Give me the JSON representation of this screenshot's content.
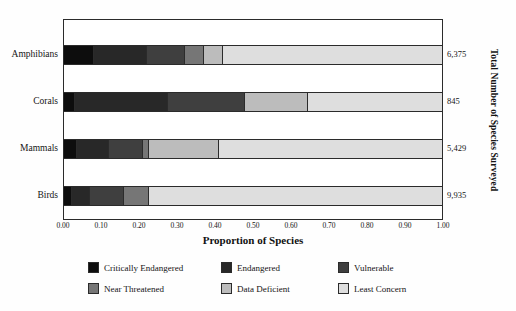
{
  "chart_data": {
    "type": "bar",
    "orientation": "horizontal",
    "stacked": true,
    "normalized": true,
    "title": "",
    "xlabel": "Proportion of Species",
    "ylabel": "Total Number of Species Surveyed",
    "xlim": [
      0,
      1
    ],
    "grid": false,
    "legend_position": "bottom",
    "xticks": [
      "0.00",
      "0.10",
      "0.20",
      "0.30",
      "0.40",
      "0.50",
      "0.60",
      "0.70",
      "0.80",
      "0.90",
      "1.00"
    ],
    "xtick_values": [
      0.0,
      0.1,
      0.2,
      0.3,
      0.4,
      0.5,
      0.6,
      0.7,
      0.8,
      0.9,
      1.0
    ],
    "categories": [
      "Amphibians",
      "Corals",
      "Mammals",
      "Birds"
    ],
    "totals": [
      "6,375",
      "845",
      "5,429",
      "9,935"
    ],
    "totals_values": [
      6375,
      845,
      5429,
      9935
    ],
    "series": [
      {
        "name": "Critically Endangered",
        "color": "#0d0d0d",
        "values": [
          0.08,
          0.03,
          0.035,
          0.02
        ]
      },
      {
        "name": "Endangered",
        "color": "#282828",
        "values": [
          0.14,
          0.245,
          0.085,
          0.05
        ]
      },
      {
        "name": "Vulnerable",
        "color": "#3f3f3f",
        "values": [
          0.1,
          0.205,
          0.09,
          0.09
        ]
      },
      {
        "name": "Near Threatened",
        "color": "#767676",
        "values": [
          0.05,
          0.0,
          0.015,
          0.065
        ]
      },
      {
        "name": "Data Deficient",
        "color": "#bcbcbc",
        "values": [
          0.05,
          0.165,
          0.185,
          0.0
        ]
      },
      {
        "name": "Least Concern",
        "color": "#dedede",
        "values": [
          0.58,
          0.355,
          0.59,
          0.775
        ]
      }
    ],
    "rows": [
      {
        "category": "Amphibians",
        "total": "6,375",
        "segments": [
          {
            "name": "Critically Endangered",
            "value": 0.08,
            "color": "#0d0d0d"
          },
          {
            "name": "Endangered",
            "value": 0.14,
            "color": "#282828"
          },
          {
            "name": "Vulnerable",
            "value": 0.1,
            "color": "#3f3f3f"
          },
          {
            "name": "Near Threatened",
            "value": 0.05,
            "color": "#767676"
          },
          {
            "name": "Data Deficient",
            "value": 0.05,
            "color": "#bcbcbc"
          },
          {
            "name": "Least Concern",
            "value": 0.58,
            "color": "#dedede"
          }
        ]
      },
      {
        "category": "Corals",
        "total": "845",
        "segments": [
          {
            "name": "Critically Endangered",
            "value": 0.03,
            "color": "#0d0d0d"
          },
          {
            "name": "Endangered",
            "value": 0.245,
            "color": "#282828"
          },
          {
            "name": "Vulnerable",
            "value": 0.205,
            "color": "#3f3f3f"
          },
          {
            "name": "Data Deficient",
            "value": 0.165,
            "color": "#bcbcbc"
          },
          {
            "name": "Least Concern",
            "value": 0.355,
            "color": "#dedede"
          }
        ]
      },
      {
        "category": "Mammals",
        "total": "5,429",
        "segments": [
          {
            "name": "Critically Endangered",
            "value": 0.035,
            "color": "#0d0d0d"
          },
          {
            "name": "Endangered",
            "value": 0.085,
            "color": "#282828"
          },
          {
            "name": "Vulnerable",
            "value": 0.09,
            "color": "#3f3f3f"
          },
          {
            "name": "Near Threatened",
            "value": 0.015,
            "color": "#767676"
          },
          {
            "name": "Data Deficient",
            "value": 0.185,
            "color": "#bcbcbc"
          },
          {
            "name": "Least Concern",
            "value": 0.59,
            "color": "#dedede"
          }
        ]
      },
      {
        "category": "Birds",
        "total": "9,935",
        "segments": [
          {
            "name": "Critically Endangered",
            "value": 0.02,
            "color": "#0d0d0d"
          },
          {
            "name": "Endangered",
            "value": 0.05,
            "color": "#282828"
          },
          {
            "name": "Vulnerable",
            "value": 0.09,
            "color": "#3f3f3f"
          },
          {
            "name": "Near Threatened",
            "value": 0.065,
            "color": "#767676"
          },
          {
            "name": "Least Concern",
            "value": 0.775,
            "color": "#dedede"
          }
        ]
      }
    ]
  },
  "legend": {
    "items": [
      {
        "label": "Critically Endangered",
        "color": "#0d0d0d"
      },
      {
        "label": "Endangered",
        "color": "#282828"
      },
      {
        "label": "Vulnerable",
        "color": "#3f3f3f"
      },
      {
        "label": "Near Threatened",
        "color": "#767676"
      },
      {
        "label": "Data Deficient",
        "color": "#bcbcbc"
      },
      {
        "label": "Least Concern",
        "color": "#dedede"
      }
    ]
  },
  "axes": {
    "x_title": "Proportion of Species",
    "y_title": "Total Number of Species Surveyed"
  }
}
